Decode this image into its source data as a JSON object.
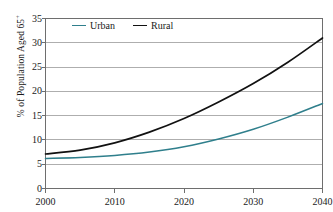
{
  "chart_data": {
    "type": "line",
    "title": "",
    "subtitle": "",
    "xlabel": "",
    "ylabel": "% of Population Aged 65+",
    "ylabel_base": "% of Population Aged 65",
    "ylabel_sup": "+",
    "x": [
      2000,
      2005,
      2010,
      2015,
      2020,
      2025,
      2030,
      2035,
      2040
    ],
    "xticks": [
      "2000",
      "2010",
      "2020",
      "2030",
      "2040"
    ],
    "xtick_values": [
      2000,
      2010,
      2020,
      2030,
      2040
    ],
    "yticks": [
      "0",
      "5",
      "10",
      "15",
      "20",
      "25",
      "30",
      "35"
    ],
    "ytick_values": [
      0,
      5,
      10,
      15,
      20,
      25,
      30,
      35
    ],
    "xlim": [
      2000,
      2040
    ],
    "ylim": [
      0,
      35
    ],
    "grid": "horizontal",
    "legend_position": "top-inside-left",
    "series": [
      {
        "name": "Urban",
        "color": "#2f7f8c",
        "values": [
          6.2,
          6.4,
          6.8,
          7.5,
          8.6,
          10.2,
          12.2,
          14.7,
          17.5
        ]
      },
      {
        "name": "Rural",
        "color": "#111111",
        "values": [
          7.1,
          7.9,
          9.4,
          11.6,
          14.4,
          17.8,
          21.6,
          26.0,
          31.0
        ]
      }
    ]
  },
  "legend": {
    "urban_label": "Urban",
    "rural_label": "Rural"
  },
  "axis": {
    "y_title": "% of Population Aged 65",
    "y_title_sup": "+"
  },
  "colors": {
    "urban": "#2f7f8c",
    "rural": "#111111",
    "grid": "#9a9a9a",
    "frame": "#6e6e6e",
    "text": "#1a1a1a",
    "background": "#ffffff"
  }
}
